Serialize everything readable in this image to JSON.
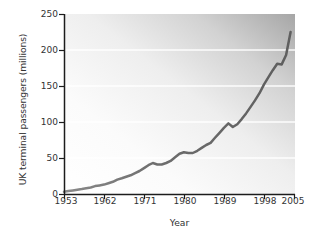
{
  "chart_data": {
    "type": "line",
    "title": "",
    "xlabel": "Year",
    "ylabel": "UK terminal passengers (millions)",
    "xlim": [
      1953,
      2005
    ],
    "ylim": [
      0,
      250
    ],
    "grid": "horizontal-white-gridlines",
    "legend": "none",
    "xticks": [
      "1953",
      "1962",
      "1971",
      "1980",
      "1989",
      "1998",
      "2005"
    ],
    "xtick_values": [
      1953,
      1962,
      1971,
      1980,
      1989,
      1998,
      2005
    ],
    "yticks": [
      "0",
      "50",
      "100",
      "150",
      "200",
      "250"
    ],
    "ytick_values": [
      0,
      50,
      100,
      150,
      200,
      250
    ],
    "series": [
      {
        "name": "UK terminal passengers",
        "color": "#6e6e6e",
        "x": [
          1953,
          1954,
          1955,
          1956,
          1957,
          1958,
          1959,
          1960,
          1961,
          1962,
          1963,
          1964,
          1965,
          1966,
          1967,
          1968,
          1969,
          1970,
          1971,
          1972,
          1973,
          1974,
          1975,
          1976,
          1977,
          1978,
          1979,
          1980,
          1981,
          1982,
          1983,
          1984,
          1985,
          1986,
          1987,
          1988,
          1989,
          1990,
          1991,
          1992,
          1993,
          1994,
          1995,
          1996,
          1997,
          1998,
          1999,
          2000,
          2001,
          2002,
          2003,
          2004
        ],
        "values": [
          3,
          4,
          5,
          6,
          7,
          8,
          9,
          11,
          12,
          13,
          15,
          17,
          20,
          22,
          24,
          26,
          29,
          32,
          36,
          40,
          43,
          41,
          41,
          43,
          46,
          51,
          56,
          58,
          57,
          57,
          60,
          64,
          68,
          71,
          78,
          85,
          92,
          98,
          93,
          97,
          104,
          112,
          121,
          130,
          140,
          152,
          162,
          172,
          181,
          180,
          193,
          225
        ]
      }
    ],
    "annotations": [
      {
        "label": "1973-74 oil crisis dip",
        "x": 1974,
        "y": 41
      },
      {
        "label": "1991 Gulf War dip",
        "x": 1991,
        "y": 93
      },
      {
        "label": "2001-02 plateau",
        "x": 2002,
        "y": 180
      }
    ]
  },
  "axes": {
    "ylabel": "UK terminal passengers (millions)",
    "xlabel": "Year"
  },
  "style": {
    "line_color": "#6e6e6e",
    "axis_color": "#1c1c1c",
    "gridline_color": "#ffffff",
    "plot_bg_light": "#fdfdfd",
    "plot_bg_dark": "#a8a8a8"
  }
}
